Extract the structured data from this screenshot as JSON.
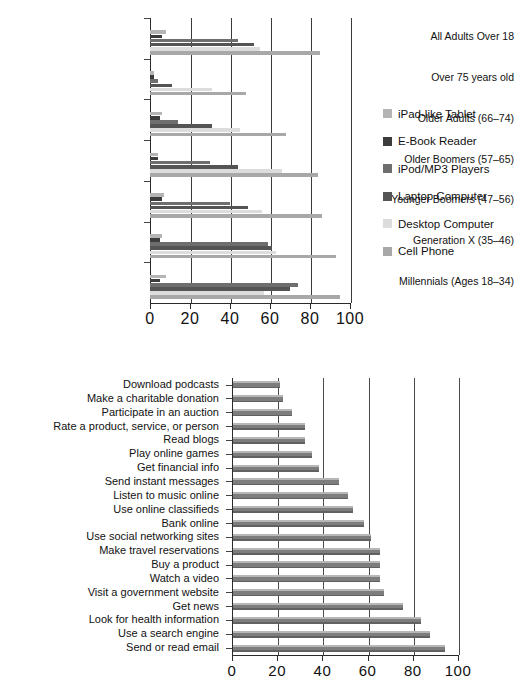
{
  "chart_data": [
    {
      "type": "bar",
      "orientation": "horizontal",
      "title": "",
      "xlabel": "",
      "ylabel": "",
      "xlim": [
        0,
        100
      ],
      "xticks": [
        0,
        20,
        40,
        60,
        80,
        100
      ],
      "grid": true,
      "legend_position": "right",
      "categories": [
        "All Adults Over 18",
        "Over 75 years old",
        "Older Adults (66–74)",
        "Older Boomers (57–65)",
        "Younger Boomers (47–56)",
        "Generation X (35–46)",
        "Millennials (Ages 18–34)"
      ],
      "series": [
        {
          "name": "iPad-like Tablet",
          "color": "#b4b4b4",
          "values": [
            8,
            2,
            6,
            4,
            7,
            6,
            8
          ]
        },
        {
          "name": "E-Book Reader",
          "color": "#3c3c3c",
          "values": [
            6,
            2,
            5,
            4,
            6,
            5,
            5
          ]
        },
        {
          "name": "iPod/MP3 Players",
          "color": "#6e6e6e",
          "values": [
            44,
            4,
            14,
            30,
            40,
            59,
            74
          ]
        },
        {
          "name": "Laptop Computer",
          "color": "#545454",
          "values": [
            52,
            11,
            31,
            44,
            49,
            61,
            70
          ]
        },
        {
          "name": "Desktop Computer",
          "color": "#dcdcdc",
          "values": [
            55,
            31,
            45,
            66,
            56,
            63,
            57
          ]
        },
        {
          "name": "Cell Phone",
          "color": "#a8a8a8",
          "values": [
            85,
            48,
            68,
            84,
            86,
            93,
            95
          ]
        }
      ]
    },
    {
      "type": "bar",
      "orientation": "horizontal",
      "title": "",
      "xlabel": "",
      "ylabel": "",
      "xlim": [
        0,
        100
      ],
      "xticks": [
        0,
        20,
        40,
        60,
        80,
        100
      ],
      "grid": true,
      "bar_color": "#7d7d7d",
      "categories": [
        "Download podcasts",
        "Make a charitable donation",
        "Participate in an auction",
        "Rate a product, service, or person",
        "Read blogs",
        "Play online games",
        "Get financial info",
        "Send instant messages",
        "Listen to music online",
        "Use online classifieds",
        "Bank online",
        "Use social networking sites",
        "Make travel reservations",
        "Buy a product",
        "Watch a video",
        "Visit a government website",
        "Get news",
        "Look for health information",
        "Use a search engine",
        "Send or read email"
      ],
      "values": [
        21,
        22,
        26,
        32,
        32,
        35,
        38,
        47,
        51,
        53,
        58,
        61,
        65,
        65,
        65,
        67,
        75,
        83,
        87,
        94
      ]
    }
  ],
  "chart1": {
    "xticks": [
      "0",
      "20",
      "40",
      "60",
      "80",
      "100"
    ],
    "legend_title": ""
  },
  "chart2": {
    "xticks": [
      "0",
      "20",
      "40",
      "60",
      "80",
      "100"
    ]
  }
}
